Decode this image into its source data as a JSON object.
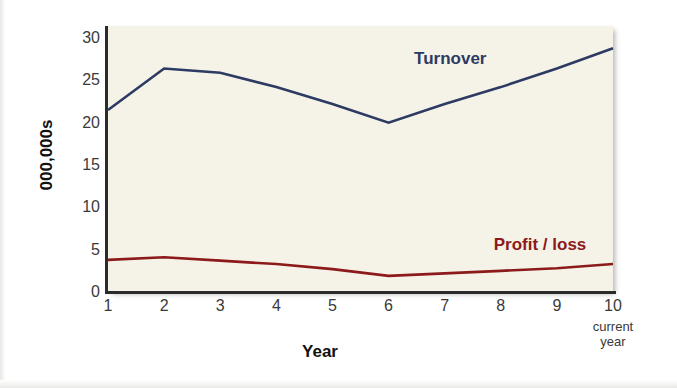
{
  "chart_data": {
    "type": "line",
    "title": "",
    "xlabel": "Year",
    "ylabel": "000,000s",
    "x": [
      1,
      2,
      3,
      4,
      5,
      6,
      7,
      8,
      9,
      10
    ],
    "categories": [
      "1",
      "2",
      "3",
      "4",
      "5",
      "6",
      "7",
      "8",
      "9",
      "10"
    ],
    "xlim": [
      1,
      10
    ],
    "ylim": [
      0,
      31
    ],
    "yticks": [
      0,
      5,
      10,
      15,
      20,
      25,
      30
    ],
    "ytick_labels": [
      "0",
      "5",
      "10",
      "15",
      "20",
      "25",
      "30"
    ],
    "xtick_labels": [
      "1",
      "2",
      "3",
      "4",
      "5",
      "6",
      "7",
      "8",
      "9",
      "10"
    ],
    "x_last_tick_sublabel": "current\nyear",
    "x_last_tick_sublabel_line1": "current",
    "x_last_tick_sublabel_line2": "year",
    "grid": false,
    "legend_position": "inline-annotation",
    "plot_background": "#f5f3e7",
    "series": [
      {
        "name": "Turnover",
        "color": "#2d3a63",
        "label_x": 7.1,
        "label_y": 27.5,
        "values": [
          21.5,
          26.4,
          25.9,
          24.2,
          22.2,
          20.0,
          22.2,
          24.2,
          26.4,
          28.8
        ]
      },
      {
        "name": "Profit / loss",
        "color": "#8c1a1a",
        "label_x": 8.7,
        "label_y": 5.5,
        "values": [
          3.8,
          4.1,
          3.7,
          3.3,
          2.7,
          1.9,
          2.2,
          2.5,
          2.8,
          3.3
        ]
      }
    ]
  },
  "colors": {
    "turnover": "#2d3a63",
    "profit_loss": "#8c1a1a",
    "plot_bg": "#f5f3e7",
    "axis": "#2b2b2b",
    "tick_text": "#3a3a3a",
    "title_text": "#111111",
    "page_bg": "#ffffff"
  }
}
